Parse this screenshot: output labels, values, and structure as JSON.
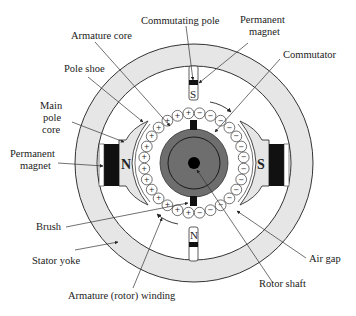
{
  "colors": {
    "yoke_fill": "#e6e6e6",
    "line": "#333333",
    "magnet": "#111111",
    "rotor_disk": "#6e6e6e",
    "shaft": "#000000"
  },
  "labels": {
    "commutating_pole": "Commutating pole",
    "permanent_magnet_top_1": "Permanent",
    "permanent_magnet_top_2": "magnet",
    "armature_core": "Armature core",
    "commutator": "Commutator",
    "pole_shoe": "Pole shoe",
    "main_pole_core_1": "Main",
    "main_pole_core_2": "pole",
    "main_pole_core_3": "core",
    "permanent_magnet_left_1": "Permanent",
    "permanent_magnet_left_2": "magnet",
    "brush": "Brush",
    "stator_yoke": "Stator yoke",
    "armature_winding": "Armature (rotor) winding",
    "air_gap": "Air gap",
    "rotor_shaft": "Rotor shaft"
  },
  "poles": {
    "main_left": "N",
    "main_right": "S",
    "commutating_top": "S",
    "commutating_bottom": "N"
  },
  "winding_signs": {
    "left_half": "+",
    "right_half": "−"
  }
}
